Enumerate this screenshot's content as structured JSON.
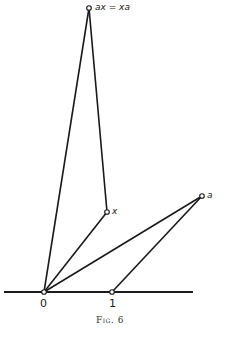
{
  "figure": {
    "caption": "Fig. 6",
    "baseline": {
      "x1": 4,
      "y1": 292,
      "x2": 193,
      "y2": 292
    },
    "points": {
      "origin": {
        "x": 44,
        "y": 292,
        "label": "0"
      },
      "one": {
        "x": 112,
        "y": 292,
        "label": "1"
      },
      "x": {
        "x": 107,
        "y": 212,
        "label": "x"
      },
      "a": {
        "x": 202,
        "y": 196,
        "label": "a"
      },
      "ax": {
        "x": 89,
        "y": 8,
        "label": "ax = xa"
      }
    },
    "segments": [
      {
        "from": "origin",
        "to": "ax"
      },
      {
        "from": "ax",
        "to": "x"
      },
      {
        "from": "origin",
        "to": "x"
      },
      {
        "from": "origin",
        "to": "a"
      },
      {
        "from": "one",
        "to": "a"
      }
    ],
    "colors": {
      "line": "#1a1a1a",
      "point_fill": "#ffffff"
    }
  }
}
